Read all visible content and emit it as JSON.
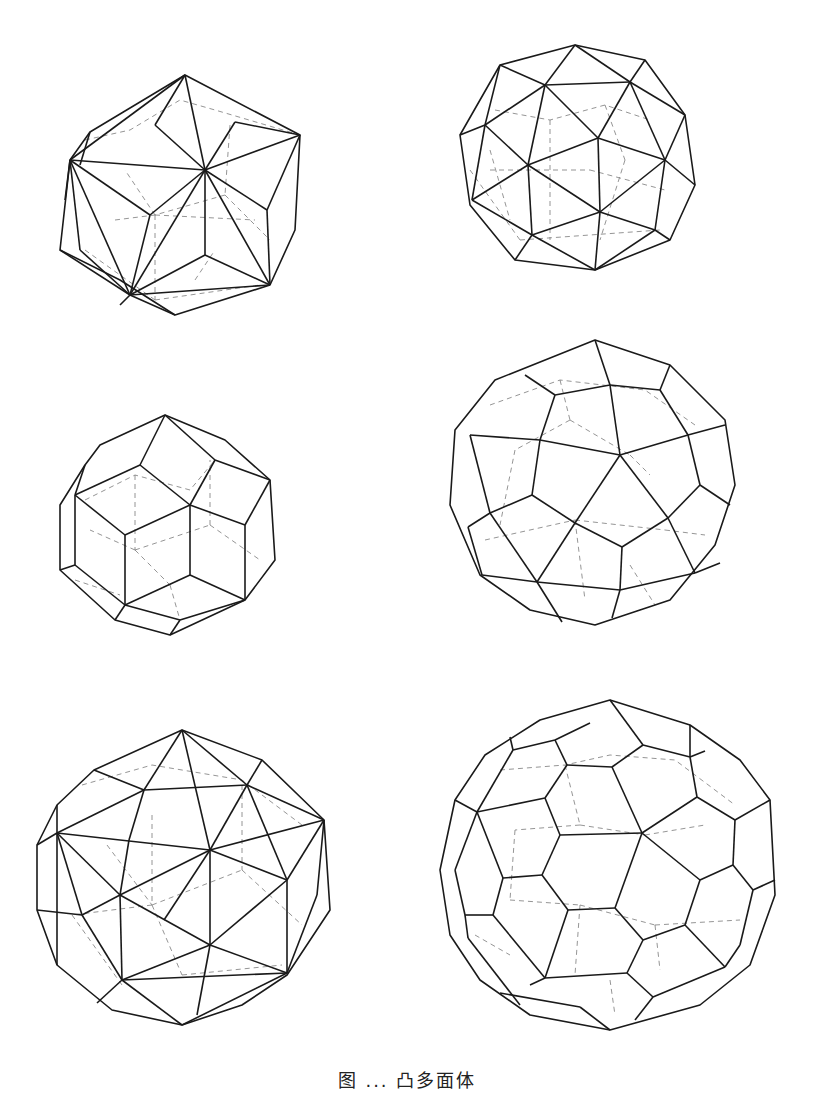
{
  "figure": {
    "caption": "图 ... 凸多面体",
    "caption_note": "caption clipped at bottom edge; only glyph tops visible",
    "line_colors": {
      "visible_edge": "#1a1a1a",
      "hidden_edge": "#7a7a7a"
    },
    "panels": [
      {
        "id": "p1",
        "row": 1,
        "col": 1,
        "description": "triakis/pentakis-like polyhedron with triangular faces, wireframe with dashed hidden edges"
      },
      {
        "id": "p2",
        "row": 1,
        "col": 2,
        "description": "snub-cube-like polyhedron of triangles and squares, wireframe"
      },
      {
        "id": "p3",
        "row": 2,
        "col": 1,
        "description": "rhombic/deltoidal polyhedron with quadrilateral faces, wireframe"
      },
      {
        "id": "p4",
        "row": 2,
        "col": 2,
        "description": "pentagonal-faced polyhedron (pentagonal icositetrahedron-like), wireframe"
      },
      {
        "id": "p5",
        "row": 3,
        "col": 1,
        "description": "pentakis-dodecahedron-like triangular faceted polyhedron, wireframe"
      },
      {
        "id": "p6",
        "row": 3,
        "col": 2,
        "description": "pentagonal hexecontahedron-like polyhedron with pentagonal faces, wireframe"
      }
    ]
  }
}
